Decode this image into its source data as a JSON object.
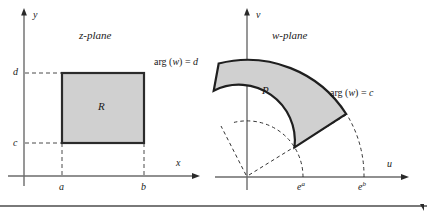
{
  "figure": {
    "kind": "conformal-mapping-diagram",
    "background_color": "#ffffff",
    "region_fill_color": "#d0d0d0",
    "region_stroke_color": "#1a1a1a",
    "axis_color": "#5a5a5a",
    "dashed_color": "#3a3a3a",
    "bottom_rule_color": "#4d4d4d"
  },
  "left_panel": {
    "title": "z-plane",
    "region_label": "R",
    "axes": {
      "horizontal_label": "x",
      "vertical_label": "y"
    },
    "ticks": {
      "x": [
        "a",
        "b"
      ],
      "y": [
        "c",
        "d"
      ]
    }
  },
  "right_panel": {
    "title": "w-plane",
    "region_label": "P",
    "axes": {
      "horizontal_label": "u",
      "vertical_label": "v"
    },
    "ticks": {
      "u": [
        "e^a",
        "e^b"
      ],
      "u_base": [
        "e",
        "e"
      ],
      "u_exponent": [
        "a",
        "b"
      ]
    },
    "ray_labels": [
      {
        "prefix": "arg (",
        "variable": "w",
        "suffix": ") = ",
        "value": "d"
      },
      {
        "prefix": "arg (",
        "variable": "w",
        "suffix": ") = ",
        "value": "c"
      }
    ]
  },
  "geometry": {
    "z_origin": {
      "x": 24,
      "y": 176
    },
    "rect": {
      "left": 62,
      "top": 73,
      "right": 144,
      "bottom": 143
    },
    "w_origin": {
      "x": 247,
      "y": 177
    },
    "inner_radius": 56,
    "outer_radius": 117,
    "angle_start_deg": 32,
    "angle_end_deg": 104
  }
}
